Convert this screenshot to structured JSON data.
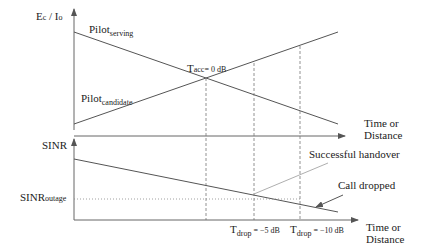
{
  "top_plot": {
    "y_axis_label": "Ec / Io",
    "y_axis_label_main": "E",
    "y_axis_label_sub": "c",
    "y_axis_label_mid": " / I",
    "y_axis_label_sub2": "o",
    "x_axis_label_line1": "Time or",
    "x_axis_label_line2": "Distance",
    "serving_label_main": "Pilot",
    "serving_label_sub": "serving",
    "candidate_label_main": "Pilot",
    "candidate_label_sub": "candidate",
    "threshold_label_main": "T",
    "threshold_label_sub": "acc",
    "threshold_label_value": "= 0 dB"
  },
  "bottom_plot": {
    "y_axis_label": "SINR",
    "outage_label_main": "SINR",
    "outage_label_sub": "outage",
    "x_axis_label_line1": "Time or",
    "x_axis_label_line2": "Distance",
    "annotation_handover": "Successful handover",
    "annotation_dropped": "Call dropped",
    "tdrop1_main": "T",
    "tdrop1_sub": "drop",
    "tdrop1_value": " = −5 dB",
    "tdrop2_main": "T",
    "tdrop2_sub": "drop",
    "tdrop2_value": " = −10 dB"
  },
  "colors": {
    "line": "#555555",
    "text": "#222222",
    "background": "#ffffff"
  }
}
